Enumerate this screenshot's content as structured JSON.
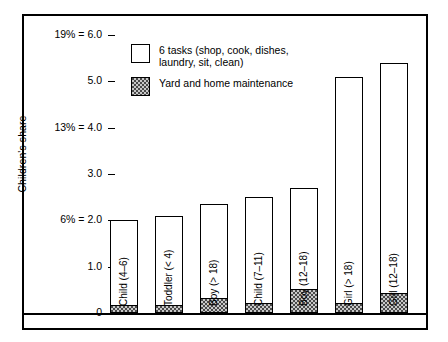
{
  "chart_data": {
    "type": "bar",
    "title": "",
    "subtitle": "",
    "xlabel": "",
    "ylabel": "Children's share",
    "ylim": [
      0,
      6.0
    ],
    "grid": false,
    "stacked": true,
    "legend_position": "inside-top-left",
    "y_ticks": [
      {
        "value": 6.0,
        "label": "19% = 6.0"
      },
      {
        "value": 5.0,
        "label": "5.0"
      },
      {
        "value": 4.0,
        "label": "13% = 4.0"
      },
      {
        "value": 3.0,
        "label": "3.0"
      },
      {
        "value": 2.0,
        "label": "6% = 2.0"
      },
      {
        "value": 1.0,
        "label": "1.0"
      },
      {
        "value": 0.0,
        "label": "0"
      }
    ],
    "categories": [
      "Child (4–6)",
      "Toddler (< 4)",
      "Boy (> 18)",
      "Child (7–11)",
      "Boy (12–18)",
      "Girl (> 18)",
      "Girl (12–18)"
    ],
    "series": [
      {
        "name": "6 tasks (shop, cook, dishes, laundry, sit, clean)",
        "swatch": "white",
        "values": [
          1.85,
          1.95,
          2.05,
          2.3,
          2.2,
          4.9,
          5.0
        ]
      },
      {
        "name": "Yard and home maintenance",
        "swatch": "shaded",
        "values": [
          0.15,
          0.15,
          0.3,
          0.2,
          0.5,
          0.2,
          0.4
        ]
      }
    ],
    "totals": [
      2.0,
      2.1,
      2.35,
      2.5,
      2.7,
      5.1,
      5.4
    ]
  },
  "legend": {
    "items": [
      {
        "swatch": "white",
        "label": "6 tasks (shop, cook, dishes,\nlaundry, sit, clean)"
      },
      {
        "swatch": "shaded",
        "label": "Yard and home maintenance"
      }
    ]
  },
  "axis": {
    "y_title": "Children's share"
  }
}
